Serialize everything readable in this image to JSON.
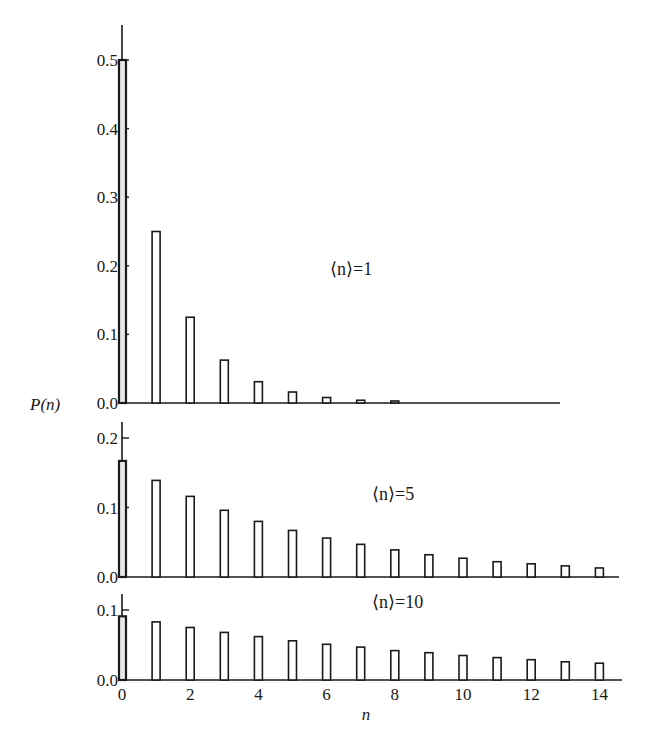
{
  "chart_data": {
    "type": "bar",
    "title": "",
    "ylabel": "P(n)",
    "xlabel": "n",
    "x_ticks": [
      0,
      2,
      4,
      6,
      8,
      10,
      12,
      14
    ],
    "panels": [
      {
        "label": "⟨n⟩=1",
        "mean": 1,
        "ylim": [
          0,
          0.5
        ],
        "y_ticks": [
          "0.0",
          "0.1",
          "0.2",
          "0.3",
          "0.4",
          "0.5"
        ],
        "x": [
          0,
          1,
          2,
          3,
          4,
          5,
          6,
          7,
          8
        ],
        "values": [
          0.5,
          0.25,
          0.125,
          0.0625,
          0.031,
          0.016,
          0.008,
          0.004,
          0.002
        ]
      },
      {
        "label": "⟨n⟩=5",
        "mean": 5,
        "ylim": [
          0,
          0.2
        ],
        "y_ticks": [
          "0.0",
          "0.1",
          "0.2"
        ],
        "x": [
          0,
          1,
          2,
          3,
          4,
          5,
          6,
          7,
          8,
          9,
          10,
          11,
          12,
          13,
          14
        ],
        "values": [
          0.167,
          0.139,
          0.116,
          0.096,
          0.08,
          0.067,
          0.056,
          0.047,
          0.039,
          0.032,
          0.027,
          0.022,
          0.019,
          0.016,
          0.013
        ]
      },
      {
        "label": "⟨n⟩=10",
        "mean": 10,
        "ylim": [
          0,
          0.1
        ],
        "y_ticks": [
          "0.0",
          "0.1"
        ],
        "x": [
          0,
          1,
          2,
          3,
          4,
          5,
          6,
          7,
          8,
          9,
          10,
          11,
          12,
          13,
          14
        ],
        "values": [
          0.091,
          0.083,
          0.075,
          0.068,
          0.062,
          0.056,
          0.051,
          0.047,
          0.042,
          0.039,
          0.035,
          0.032,
          0.029,
          0.026,
          0.024
        ]
      }
    ],
    "grid": false,
    "legend": "none"
  }
}
